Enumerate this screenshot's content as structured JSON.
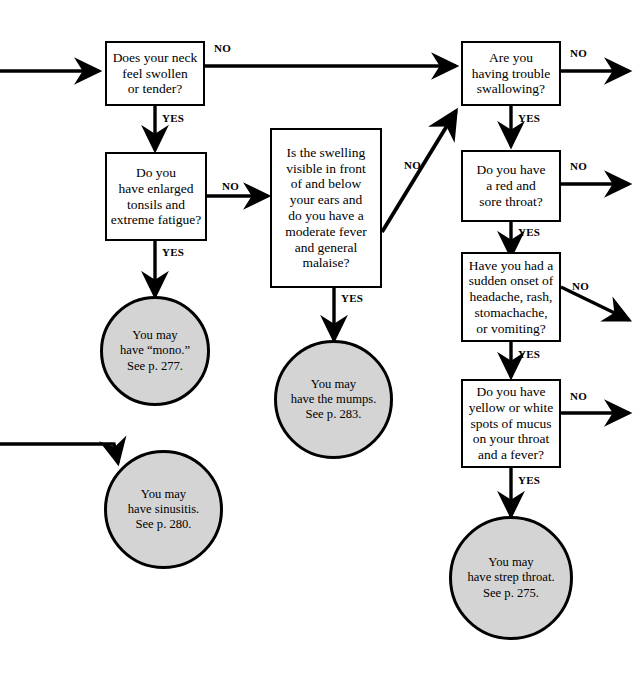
{
  "diagram": {
    "background_color": "#ffffff",
    "line_color": "#000000",
    "terminal_fill_color": "#d4d4d4"
  },
  "nodes": {
    "neck": {
      "type": "decision",
      "text": "Does your neck\nfeel swollen\nor tender?"
    },
    "tonsils": {
      "type": "decision",
      "text": "Do you\nhave enlarged\ntonsils and\nextreme fatigue?"
    },
    "swelling": {
      "type": "decision",
      "text": "Is the swelling\nvisible in front\nof and below\nyour ears and\ndo you have a\nmoderate fever\nand general\nmalaise?"
    },
    "swallowing": {
      "type": "decision",
      "text": "Are you\nhaving trouble\nswallowing?"
    },
    "sore_throat": {
      "type": "decision",
      "text": "Do you have\na red and\nsore throat?"
    },
    "sudden_onset": {
      "type": "decision",
      "text": "Have you had a\nsudden onset of\nheadache, rash,\nstomachache,\nor vomiting?"
    },
    "mucus": {
      "type": "decision",
      "text": "Do you have\nyellow or white\nspots of mucus\non your throat\nand a fever?"
    },
    "mono": {
      "type": "terminal",
      "text": "You may\nhave “mono.”\nSee p. 277."
    },
    "mumps": {
      "type": "terminal",
      "text": "You may\nhave the mumps.\nSee p. 283."
    },
    "sinusitis": {
      "type": "terminal",
      "text": "You may\nhave sinusitis.\nSee p. 280."
    },
    "strep": {
      "type": "terminal",
      "text": "You may\nhave strep throat.\nSee p. 275."
    }
  },
  "edge_labels": {
    "neck_no": "NO",
    "neck_yes": "YES",
    "tonsils_no": "NO",
    "tonsils_yes": "YES",
    "swelling_no": "NO",
    "swelling_yes": "YES",
    "swallowing_no": "NO",
    "swallowing_yes": "YES",
    "sore_throat_no": "NO",
    "sore_throat_yes": "YES",
    "sudden_onset_no": "NO",
    "sudden_onset_yes": "YES",
    "mucus_no": "NO",
    "mucus_yes": "YES"
  }
}
